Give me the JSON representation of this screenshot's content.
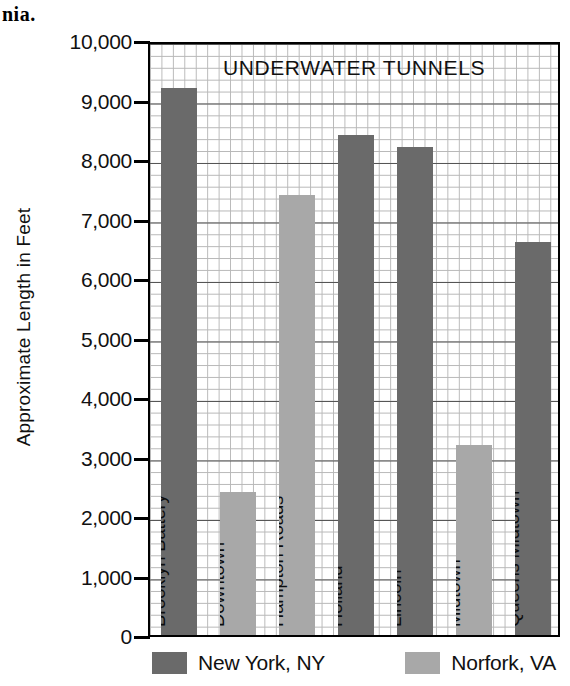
{
  "page_fragment": "nia.",
  "chart_data": {
    "type": "bar",
    "title": "UNDERWATER TUNNELS",
    "xlabel": "",
    "ylabel": "Approximate Length in Feet",
    "ylim": [
      0,
      10000
    ],
    "ytick_step": 1000,
    "grid": true,
    "legend_position": "bottom",
    "ytick_labels": [
      "10,000",
      "9,000",
      "8,000",
      "7,000",
      "6,000",
      "5,000",
      "4,000",
      "3,000",
      "2,000",
      "1,000",
      "0"
    ],
    "ytick_values": [
      10000,
      9000,
      8000,
      7000,
      6000,
      5000,
      4000,
      3000,
      2000,
      1000,
      0
    ],
    "categories": [
      "Brooklyn Battery",
      "Downtown",
      "Hampton Roads",
      "Holland",
      "Lincoln",
      "Midtown",
      "Queens Midtown"
    ],
    "values": [
      9200,
      2400,
      7400,
      8400,
      8200,
      3200,
      6600
    ],
    "groups": [
      "New York, NY",
      "Norfork, VA",
      "Norfork, VA",
      "New York, NY",
      "New York, NY",
      "Norfork, VA",
      "New York, NY"
    ],
    "series": [
      {
        "name": "New York, NY",
        "color": "#6a6a6a",
        "points": [
          {
            "category": "Brooklyn Battery",
            "value": 9200
          },
          {
            "category": "Holland",
            "value": 8400
          },
          {
            "category": "Lincoln",
            "value": 8200
          },
          {
            "category": "Queens Midtown",
            "value": 6600
          }
        ]
      },
      {
        "name": "Norfork, VA",
        "color": "#a8a8a8",
        "points": [
          {
            "category": "Downtown",
            "value": 2400
          },
          {
            "category": "Hampton Roads",
            "value": 7400
          },
          {
            "category": "Midtown",
            "value": 3200
          }
        ]
      }
    ],
    "legend": [
      {
        "label": "New York, NY",
        "color": "#6a6a6a"
      },
      {
        "label": "Norfork, VA",
        "color": "#a8a8a8"
      }
    ]
  }
}
